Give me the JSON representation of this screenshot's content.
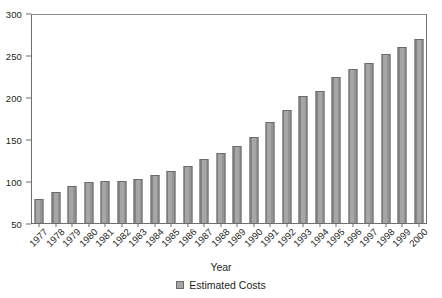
{
  "chart_data": {
    "type": "bar",
    "title": "",
    "xlabel": "Year",
    "ylabel": "",
    "ylim": [
      50,
      300
    ],
    "ytick_step": 50,
    "yticks": [
      50,
      100,
      150,
      200,
      250,
      300
    ],
    "grid": false,
    "legend_position": "bottom-center",
    "series_name": "Estimated Costs",
    "categories": [
      "1977",
      "1978",
      "1979",
      "1980",
      "1981",
      "1982",
      "1983",
      "1984",
      "1985",
      "1986",
      "1987",
      "1988",
      "1989",
      "1990",
      "1991",
      "1992",
      "1993",
      "1994",
      "1995",
      "1996",
      "1997",
      "1998",
      "1999",
      "2000"
    ],
    "values": [
      80,
      88,
      95,
      100,
      101,
      101,
      104,
      108,
      113,
      119,
      127,
      134,
      143,
      153,
      171,
      186,
      202,
      208,
      225,
      234,
      242,
      252,
      261,
      270
    ]
  },
  "legend": {
    "entries": [
      {
        "label": "Estimated Costs",
        "color": "#a6a6a6"
      }
    ]
  },
  "axis": {
    "x_title": "Year"
  },
  "colors": {
    "bar_fill": "#a6a6a6",
    "bar_stroke": "#6a6a6a",
    "axis": "#6f6f6f",
    "text": "#231f20",
    "background": "#ffffff"
  }
}
